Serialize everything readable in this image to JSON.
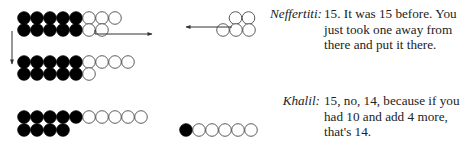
{
  "dialogue": [
    {
      "speaker": "Neffertiti:",
      "lines": [
        "15. It was 15 before. You",
        "just took one away from",
        "there and put it there."
      ]
    },
    {
      "speaker": "Khalil:",
      "lines": [
        "15, no, 14, because if you",
        "had 10 and add 4 more,",
        "that's 14."
      ]
    }
  ],
  "diagram": {
    "colors": {
      "filled": "#000000",
      "empty": "#ffffff",
      "stroke": "#333333",
      "arrow": "#333333"
    },
    "bead_groups": [
      {
        "name": "group-initial-15",
        "rows": [
          {
            "filled": 5,
            "empty": 3
          },
          {
            "filled": 5,
            "empty": 2
          }
        ]
      },
      {
        "name": "group-moved-15",
        "rows": [
          {
            "filled": 5,
            "empty": 4
          },
          {
            "filled": 5,
            "empty": 1
          }
        ]
      },
      {
        "name": "group-14",
        "rows": [
          {
            "filled": 5,
            "empty": 5
          },
          {
            "filled": 4,
            "empty": 0
          }
        ]
      },
      {
        "name": "group-removed-6",
        "rows": [
          {
            "filled": 1,
            "empty": 5
          }
        ]
      },
      {
        "name": "group-cluster-5",
        "rows": [
          {
            "filled": 0,
            "empty": 2
          },
          {
            "filled": 0,
            "empty": 3
          }
        ]
      }
    ],
    "arrows": [
      {
        "name": "arrow-down",
        "direction": "down"
      },
      {
        "name": "arrow-right",
        "direction": "right"
      },
      {
        "name": "arrow-left",
        "direction": "left"
      }
    ]
  }
}
